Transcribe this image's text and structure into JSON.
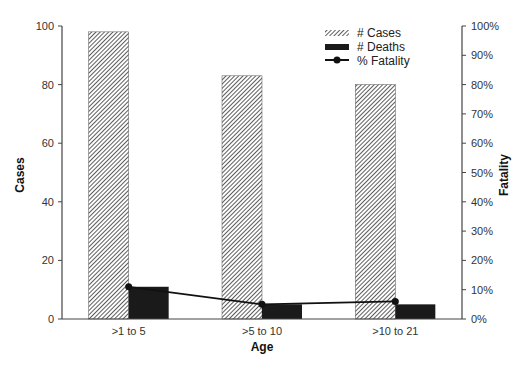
{
  "chart_data": {
    "type": "bar",
    "title": "",
    "xlabel": "Age",
    "ylabel": "Cases",
    "y2label": "Fatality",
    "categories": [
      ">1 to 5",
      ">5 to 10",
      ">10 to 21"
    ],
    "series": [
      {
        "name": "# Cases",
        "type": "bar",
        "axis": "left",
        "values": [
          98,
          83,
          80
        ]
      },
      {
        "name": "# Deaths",
        "type": "bar",
        "axis": "left",
        "values": [
          11,
          5,
          5
        ]
      },
      {
        "name": "% Fatality",
        "type": "line",
        "axis": "right",
        "values": [
          11,
          5,
          6
        ]
      }
    ],
    "ylim": [
      0,
      100
    ],
    "y2lim": [
      0,
      100
    ],
    "yticks": [
      "0",
      "20",
      "40",
      "60",
      "80",
      "100"
    ],
    "y2ticks": [
      "0%",
      "10%",
      "20%",
      "30%",
      "40%",
      "50%",
      "60%",
      "70%",
      "80%",
      "90%",
      "100%"
    ],
    "grid": false,
    "legend_position": "top-right-inside"
  },
  "legend": {
    "cases": "# Cases",
    "deaths": "# Deaths",
    "fatality": "% Fatality"
  }
}
